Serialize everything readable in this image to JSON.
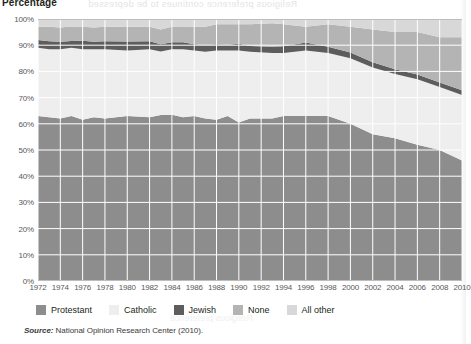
{
  "axis_title": "Percentage",
  "bleed_text": "Religious preference continues to be depressed",
  "bleed_text2": "Religious preference",
  "source": {
    "keyword": "Source:",
    "text": " National Opinion Research Center (2010)."
  },
  "legend": {
    "items": [
      {
        "label": "Protestant",
        "color": "#8d8d8d",
        "name": "protestant"
      },
      {
        "label": "Catholic",
        "color": "#eeeeee",
        "name": "catholic"
      },
      {
        "label": "Jewish",
        "color": "#5d5d5d",
        "name": "jewish"
      },
      {
        "label": "None",
        "color": "#b4b4b4",
        "name": "none"
      },
      {
        "label": "All other",
        "color": "#d8d8d8",
        "name": "all-other"
      }
    ]
  },
  "chart_data": {
    "type": "area",
    "title": "Percentage",
    "xlabel": "",
    "ylabel": "Percentage",
    "ylim": [
      0,
      100
    ],
    "xlim": [
      1972,
      2010
    ],
    "grid": true,
    "stacked": true,
    "legend_position": "bottom",
    "ytick_labels": [
      "0%",
      "10%",
      "20%",
      "30%",
      "40%",
      "50%",
      "60%",
      "70%",
      "80%",
      "90%",
      "100%"
    ],
    "ytick_values": [
      0,
      10,
      20,
      30,
      40,
      50,
      60,
      70,
      80,
      90,
      100
    ],
    "categories": [
      1972,
      1973,
      1974,
      1975,
      1976,
      1977,
      1978,
      1980,
      1982,
      1983,
      1984,
      1985,
      1986,
      1987,
      1988,
      1989,
      1990,
      1991,
      1993,
      1994,
      1996,
      1998,
      2000,
      2002,
      2004,
      2006,
      2008,
      2010
    ],
    "xtick_labels": [
      "1972",
      "1974",
      "1976",
      "1978",
      "1980",
      "1982",
      "1984",
      "1986",
      "1988",
      "1990",
      "1992",
      "1994",
      "1996",
      "1998",
      "2000",
      "2002",
      "2004",
      "2006",
      "2008",
      "2010"
    ],
    "xtick_values": [
      1972,
      1974,
      1976,
      1978,
      1980,
      1982,
      1984,
      1986,
      1988,
      1990,
      1992,
      1994,
      1996,
      1998,
      2000,
      2002,
      2004,
      2006,
      2008,
      2010
    ],
    "series": [
      {
        "name": "Protestant",
        "color": "#8d8d8d",
        "values": [
          63,
          62.5,
          62,
          63,
          61.5,
          62.5,
          62,
          63,
          62.5,
          64,
          63.5,
          62.5,
          63,
          62,
          61.5,
          63,
          60.5,
          62,
          62,
          63,
          63,
          63,
          60,
          56,
          54.5,
          52,
          50,
          46
        ]
      },
      {
        "name": "Catholic",
        "color": "#eeeeee",
        "values": [
          26,
          26,
          26.5,
          26,
          27,
          26,
          26.5,
          25,
          26,
          24.5,
          25,
          26,
          25,
          25.5,
          26.5,
          25,
          27.5,
          25.5,
          25,
          24,
          25,
          24,
          25,
          25.5,
          24.5,
          25,
          24,
          25
        ]
      },
      {
        "name": "Jewish",
        "color": "#5d5d5d",
        "values": [
          3,
          3,
          2.8,
          2.6,
          3.2,
          2.8,
          3,
          3.4,
          3,
          2.8,
          2.6,
          2.6,
          2.4,
          2.6,
          2.4,
          2.2,
          2.6,
          2.2,
          2.4,
          2.6,
          3,
          2.4,
          2.2,
          2,
          1.8,
          1.8,
          1.8,
          1.8
        ]
      },
      {
        "name": "None",
        "color": "#b4b4b4",
        "values": [
          5,
          5.5,
          5.5,
          5.5,
          5.3,
          5.5,
          5.5,
          5.6,
          5.5,
          5.7,
          5.9,
          6,
          6.6,
          6.9,
          7.6,
          7.8,
          7.4,
          8.3,
          9,
          8.4,
          6,
          8.6,
          9.8,
          12.5,
          14.2,
          16.2,
          17.2,
          20.2
        ]
      },
      {
        "name": "All other",
        "color": "#d8d8d8",
        "values": [
          3,
          3,
          3.2,
          2.9,
          3,
          3.2,
          3,
          3,
          3,
          4,
          3,
          2.9,
          3,
          3,
          2,
          2,
          2,
          2,
          1.6,
          2,
          3,
          2,
          3,
          4,
          5,
          5,
          7,
          7
        ]
      }
    ]
  }
}
